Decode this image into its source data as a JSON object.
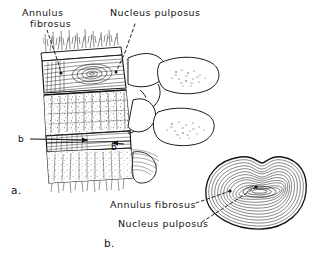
{
  "figure": {
    "caption_a": "a.",
    "caption_b": "b.",
    "labels": {
      "annulus_line1": "Annulus",
      "annulus_line2": "fibrosus",
      "nucleus_top": "Nucleus pulposus",
      "annulus_bottom": "Annulus fibrosus",
      "nucleus_bottom": "Nucleus pulposus"
    },
    "section_markers": {
      "left": "b",
      "right": "b′"
    },
    "colors": {
      "ink": "#141414",
      "background": "#ffffff",
      "hatch": "#2a2a2a",
      "leader": "#1a1a1a"
    }
  }
}
